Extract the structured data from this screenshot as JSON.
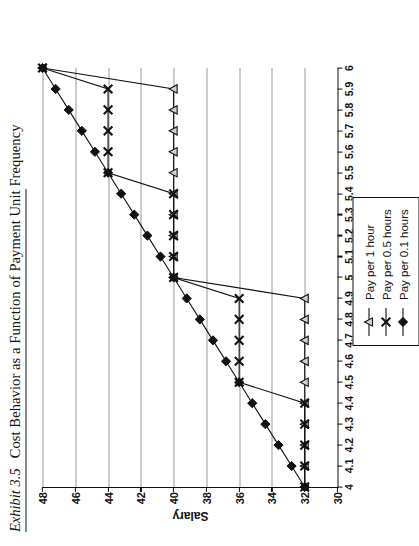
{
  "title": {
    "exhibit": "Exhibit 3.5",
    "caption": "Cost Behavior as a Function of Payment Unit Frequency"
  },
  "chart_data": {
    "type": "line",
    "title": "Cost Behavior as a Function of Payment Unit Frequency",
    "xlabel": "Hours Worked",
    "ylabel": "Salary",
    "xlim": [
      4,
      6
    ],
    "ylim": [
      30,
      48
    ],
    "xticks": [
      "4",
      "4.1",
      "4.2",
      "4.3",
      "4.4",
      "4.5",
      "4.6",
      "4.7",
      "4.8",
      "4.9",
      "5",
      "5.1",
      "5.2",
      "5.3",
      "5.4",
      "5.5",
      "5.6",
      "5.7",
      "5.8",
      "5.9",
      "6"
    ],
    "yticks": [
      "30",
      "32",
      "34",
      "36",
      "38",
      "40",
      "42",
      "44",
      "46",
      "48"
    ],
    "grid": "horizontal",
    "legend_position": "below-right",
    "x": [
      4,
      4.1,
      4.2,
      4.3,
      4.4,
      4.5,
      4.6,
      4.7,
      4.8,
      4.9,
      5,
      5.1,
      5.2,
      5.3,
      5.4,
      5.5,
      5.6,
      5.7,
      5.8,
      5.9,
      6
    ],
    "series": [
      {
        "name": "Pay per 1 hour",
        "marker": "triangle-open",
        "color": "#111111",
        "values": [
          32,
          32,
          32,
          32,
          32,
          32,
          32,
          32,
          32,
          32,
          40,
          40,
          40,
          40,
          40,
          40,
          40,
          40,
          40,
          40,
          48
        ]
      },
      {
        "name": "Pay per 0.5 hours",
        "marker": "x",
        "color": "#111111",
        "values": [
          32,
          32,
          32,
          32,
          32,
          36,
          36,
          36,
          36,
          36,
          40,
          40,
          40,
          40,
          40,
          44,
          44,
          44,
          44,
          44,
          48
        ]
      },
      {
        "name": "Pay per 0.1 hours",
        "marker": "diamond-filled",
        "color": "#111111",
        "values": [
          32,
          32.8,
          33.6,
          34.4,
          35.2,
          36,
          36.8,
          37.6,
          38.4,
          39.2,
          40,
          40.8,
          41.6,
          42.4,
          43.2,
          44,
          44.8,
          45.6,
          46.4,
          47.2,
          48
        ]
      }
    ]
  }
}
